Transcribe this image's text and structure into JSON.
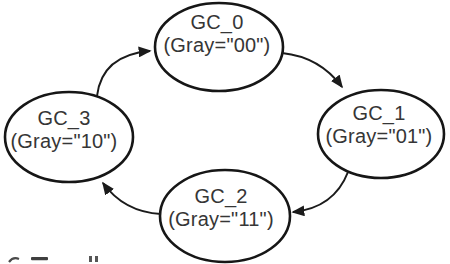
{
  "figure": {
    "type": "state-transition-diagram",
    "description_visible_content": "Four elliptical states connected in a clockwise cycle by curved arrows"
  },
  "nodes": [
    {
      "label": "GC_0",
      "sublabel": "(Gray=\"00\")",
      "position": "top"
    },
    {
      "label": "GC_1",
      "sublabel": "(Gray=\"01\")",
      "position": "right"
    },
    {
      "label": "GC_2",
      "sublabel": "(Gray=\"11\")",
      "position": "bottom"
    },
    {
      "label": "GC_3",
      "sublabel": "(Gray=\"10\")",
      "position": "left"
    }
  ],
  "edges": [
    {
      "from": "GC_3",
      "to": "GC_0"
    },
    {
      "from": "GC_0",
      "to": "GC_1"
    },
    {
      "from": "GC_1",
      "to": "GC_2"
    },
    {
      "from": "GC_2",
      "to": "GC_3"
    }
  ],
  "colors": {
    "background": "#ffffff",
    "ellipse_stroke": "#161616",
    "arrow_stroke": "#1b1b1b",
    "text": "#363636"
  }
}
